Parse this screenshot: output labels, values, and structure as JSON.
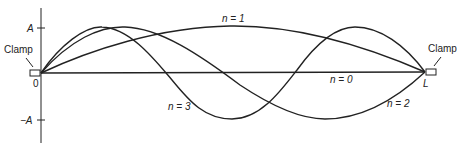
{
  "figure": {
    "axis": {
      "y_ticks": [
        {
          "label": "A",
          "y": 28
        },
        {
          "label": "−A",
          "y": 120
        }
      ],
      "origin_label": "0",
      "end_label": "L"
    },
    "clamps": [
      {
        "label": "Clamp",
        "side": "left"
      },
      {
        "label": "Clamp",
        "side": "right"
      }
    ],
    "modes": [
      {
        "n": 0,
        "label": "n = 0",
        "shape": "flat line"
      },
      {
        "n": 1,
        "label": "n = 1",
        "shape": "single positive hump"
      },
      {
        "n": 2,
        "label": "n = 2",
        "shape": "positive hump then negative trough"
      },
      {
        "n": 3,
        "label": "n = 3",
        "shape": "positive, negative, positive lobes"
      }
    ]
  },
  "colors": {
    "stroke": "#222222",
    "background": "#ffffff"
  }
}
